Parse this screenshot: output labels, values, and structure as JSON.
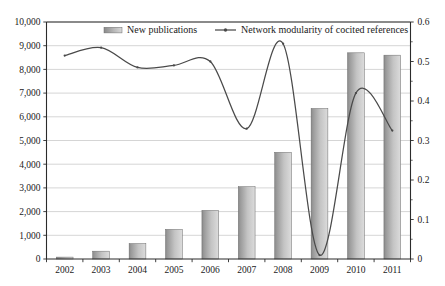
{
  "chart_data": {
    "type": "bar",
    "title": "",
    "subtitle": "",
    "xlabel": "",
    "ylabel": "",
    "categories": [
      "2002",
      "2003",
      "2004",
      "2005",
      "2006",
      "2007",
      "2008",
      "2009",
      "2010",
      "2011"
    ],
    "grid": true,
    "legend_position": "top-center",
    "series": [
      {
        "name": "New publications",
        "type": "bar",
        "axis": "left",
        "values": [
          80,
          330,
          650,
          1250,
          2050,
          3050,
          4500,
          6350,
          8700,
          8600
        ]
      },
      {
        "name": "Network modularity of cocited references",
        "type": "line",
        "axis": "right",
        "values": [
          0.515,
          0.535,
          0.485,
          0.49,
          0.5,
          0.33,
          0.545,
          0.01,
          0.42,
          0.325
        ]
      }
    ],
    "left_axis": {
      "min": 0,
      "max": 10000,
      "step": 1000,
      "tick_labels": [
        "0",
        "1,000",
        "2,000",
        "3,000",
        "4,000",
        "5,000",
        "6,000",
        "7,000",
        "8,000",
        "9,000",
        "10,000"
      ]
    },
    "right_axis": {
      "min": 0,
      "max": 0.6,
      "step": 0.1,
      "minor_step": 0.05,
      "tick_labels": [
        "0",
        "0.1",
        "0.2",
        "0.3",
        "0.4",
        "0.5",
        "0.6"
      ]
    },
    "colors": {
      "bar_fill_dark": "#8f8f8f",
      "bar_fill_light": "#d8d8d8",
      "bar_stroke": "#6b6b6b",
      "line": "#4a4a4a",
      "gridline": "#b9b9b9",
      "axis": "#2b2b2b",
      "background": "#ffffff",
      "text": "#1a1a1a"
    }
  },
  "legend": {
    "items": [
      {
        "label": "New publications",
        "marker": "bar-swatch"
      },
      {
        "label": "Network modularity of cocited references",
        "marker": "line-marker"
      }
    ]
  }
}
